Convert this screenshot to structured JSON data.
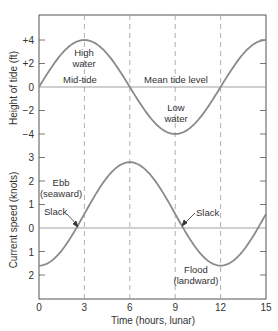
{
  "chart_data": [
    {
      "type": "line",
      "title": "",
      "xlabel": "Time (hours, lunar)",
      "ylabel": "Height of tide (ft)",
      "x_ticks": [
        0,
        3,
        6,
        9,
        12,
        15
      ],
      "y_ticks": [
        4,
        2,
        0,
        -2,
        -4
      ],
      "y_tick_labels": [
        "+4",
        "+2",
        "0",
        "−2",
        "−4"
      ],
      "xlim": [
        0,
        15
      ],
      "ylim": [
        -6,
        6
      ],
      "grid": "dashed vertical lines at 3, 6, 9, 12",
      "series": [
        {
          "name": "Tide height",
          "x": [
            0,
            1.5,
            3,
            4.5,
            6,
            7.5,
            9,
            10.5,
            12,
            13.5,
            15
          ],
          "values": [
            0,
            2.83,
            4,
            2.83,
            0,
            -2.83,
            -4,
            -2.83,
            0,
            2.83,
            4
          ]
        }
      ],
      "annotations": [
        {
          "text": "High water",
          "x": 3,
          "y": 3
        },
        {
          "text": "Mid-tide",
          "x": 3,
          "y": 0.5
        },
        {
          "text": "Mean tide level",
          "x": 9,
          "y": 0.5
        },
        {
          "text": "Low water",
          "x": 9,
          "y": -2
        }
      ]
    },
    {
      "type": "line",
      "title": "",
      "xlabel": "Time (hours, lunar)",
      "ylabel": "Current speed (knots)",
      "x_ticks": [
        0,
        3,
        6,
        9,
        12,
        15
      ],
      "y_ticks": [
        3,
        2,
        1,
        0,
        -1,
        -2
      ],
      "y_tick_labels": [
        "3",
        "2",
        "1",
        "0",
        "1",
        "2"
      ],
      "xlim": [
        0,
        15
      ],
      "ylim": [
        -3,
        3.2
      ],
      "series": [
        {
          "name": "Current speed",
          "x": [
            0,
            1.5,
            2.6,
            3,
            4.5,
            6,
            7.5,
            9,
            9.4,
            10.5,
            12,
            13.5,
            15
          ],
          "values": [
            -1.6,
            -1.0,
            0,
            0.5,
            2.2,
            2.8,
            2.2,
            0.4,
            0,
            -1.0,
            -1.6,
            -1.0,
            0.5
          ]
        }
      ],
      "annotations": [
        {
          "text": "Ebb (seaward)",
          "x": 1.7,
          "y": 1.6
        },
        {
          "text": "Slack",
          "x": 2.6,
          "y": 0
        },
        {
          "text": "Slack",
          "x": 9.4,
          "y": 0
        },
        {
          "text": "Flood (landward)",
          "x": 12,
          "y": -2.3
        }
      ]
    }
  ],
  "labels": {
    "tide_ylabel": "Height of tide (ft)",
    "current_ylabel": "Current speed (knots)",
    "xlabel": "Time (hours, lunar)",
    "high_water_1": "High",
    "high_water_2": "water",
    "mid_tide": "Mid-tide",
    "mean_tide_level": "Mean tide level",
    "low_water_1": "Low",
    "low_water_2": "water",
    "ebb_1": "Ebb",
    "ebb_2": "(seaward)",
    "slack_left": "Slack",
    "slack_right": "Slack",
    "flood_1": "Flood",
    "flood_2": "(landward)"
  },
  "ticks": {
    "x": [
      "0",
      "3",
      "6",
      "9",
      "12",
      "15"
    ],
    "tide_y": [
      "+4",
      "+2",
      "0",
      "−2",
      "−4"
    ],
    "current_y": [
      "3",
      "2",
      "1",
      "0",
      "1",
      "2"
    ]
  },
  "colors": {
    "curve": "#8a8a8a",
    "axis": "#555555",
    "text": "#333333",
    "grid": "#9a9a9a"
  }
}
